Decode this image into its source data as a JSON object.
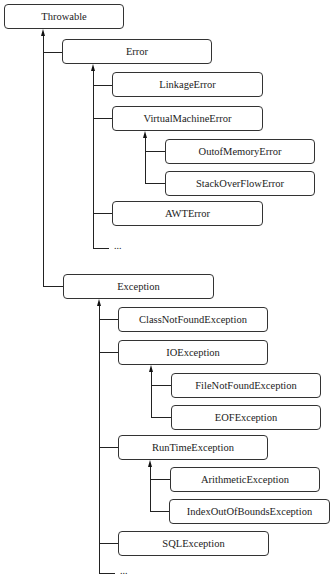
{
  "diagram": {
    "type": "class-hierarchy",
    "root": "Throwable",
    "nodes": {
      "throwable": "Throwable",
      "error": "Error",
      "linkage_error": "LinkageError",
      "virtual_machine_error": "VirtualMachineError",
      "out_of_memory_error": "OutofMemoryError",
      "stack_overflow_error": "StackOverFlowError",
      "awt_error": "AWTError",
      "error_more": "...",
      "exception": "Exception",
      "class_not_found_exception": "ClassNotFoundException",
      "io_exception": "IOException",
      "file_not_found_exception": "FileNotFoundException",
      "eof_exception": "EOFException",
      "runtime_exception": "RunTimeException",
      "arithmetic_exception": "ArithmeticException",
      "index_out_of_bounds_exception": "IndexOutOfBoundsException",
      "sql_exception": "SQLException",
      "exception_more": "..."
    },
    "edges": [
      [
        "Error",
        "Throwable"
      ],
      [
        "Exception",
        "Throwable"
      ],
      [
        "LinkageError",
        "Error"
      ],
      [
        "VirtualMachineError",
        "Error"
      ],
      [
        "AWTError",
        "Error"
      ],
      [
        "...",
        "Error"
      ],
      [
        "OutofMemoryError",
        "VirtualMachineError"
      ],
      [
        "StackOverFlowError",
        "VirtualMachineError"
      ],
      [
        "ClassNotFoundException",
        "Exception"
      ],
      [
        "IOException",
        "Exception"
      ],
      [
        "RunTimeException",
        "Exception"
      ],
      [
        "SQLException",
        "Exception"
      ],
      [
        "...",
        "Exception"
      ],
      [
        "FileNotFoundException",
        "IOException"
      ],
      [
        "EOFException",
        "IOException"
      ],
      [
        "ArithmeticException",
        "RunTimeException"
      ],
      [
        "IndexOutOfBoundsException",
        "RunTimeException"
      ]
    ]
  }
}
